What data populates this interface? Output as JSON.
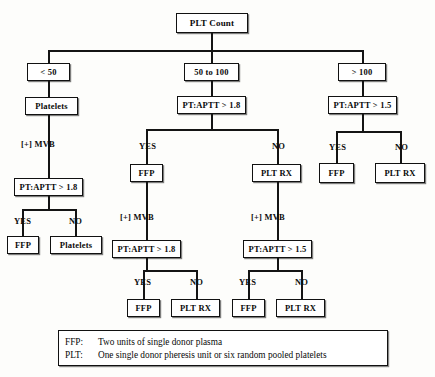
{
  "diagram": {
    "root": {
      "label": "PLT Count"
    },
    "level2": {
      "left": {
        "label": "< 50"
      },
      "middle": {
        "label": "50 to 100"
      },
      "right": {
        "label": "> 100"
      }
    },
    "left_branch": {
      "treatment": {
        "label": "Platelets"
      },
      "edge_mvb": {
        "label": "[+] MVB"
      },
      "test": {
        "label": "PT:APTT > 1.8"
      },
      "edge_yes": {
        "label": "YES"
      },
      "edge_no": {
        "label": "NO"
      },
      "yes_outcome": {
        "label": "FFP"
      },
      "no_outcome": {
        "label": "Platelets"
      }
    },
    "middle_branch": {
      "test": {
        "label": "PT:APTT > 1.8"
      },
      "edge_yes": {
        "label": "YES"
      },
      "edge_no": {
        "label": "NO"
      },
      "yes_outcome": {
        "label": "FFP"
      },
      "no_outcome": {
        "label": "PLT RX"
      },
      "yes_sub": {
        "edge_mvb": {
          "label": "[+] MVB"
        },
        "test": {
          "label": "PT:APTT > 1.8"
        },
        "edge_yes": {
          "label": "YES"
        },
        "edge_no": {
          "label": "NO"
        },
        "yes_outcome": {
          "label": "FFP"
        },
        "no_outcome": {
          "label": "PLT RX"
        }
      },
      "no_sub": {
        "edge_mvb": {
          "label": "[+] MVB"
        },
        "test": {
          "label": "PT:APTT > 1.5"
        },
        "edge_yes": {
          "label": "YES"
        },
        "edge_no": {
          "label": "NO"
        },
        "yes_outcome": {
          "label": "FFP"
        },
        "no_outcome": {
          "label": "PLT RX"
        }
      }
    },
    "right_branch": {
      "test": {
        "label": "PT:APTT > 1.5"
      },
      "edge_yes": {
        "label": "YES"
      },
      "edge_no": {
        "label": "NO"
      },
      "yes_outcome": {
        "label": "FFP"
      },
      "no_outcome": {
        "label": "PLT RX"
      }
    },
    "legend": {
      "rows": [
        {
          "key": "FFP:",
          "text": "Two units of single donor plasma"
        },
        {
          "key": "PLT:",
          "text": "One single donor pheresis unit or six random pooled platelets"
        }
      ]
    }
  }
}
